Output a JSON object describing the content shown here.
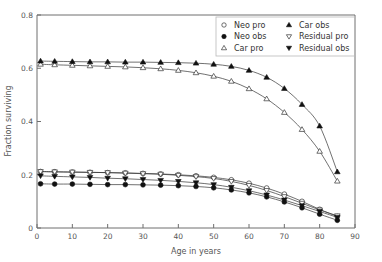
{
  "chart_data": {
    "type": "line",
    "title": "",
    "xlabel": "Age in years",
    "ylabel": "Fraction surviving",
    "xlim": [
      0,
      90
    ],
    "ylim": [
      0,
      0.8
    ],
    "xticks": [
      "0",
      "10",
      "20",
      "30",
      "40",
      "50",
      "60",
      "70",
      "80",
      "90"
    ],
    "xtick_values": [
      0,
      10,
      20,
      30,
      40,
      50,
      60,
      70,
      80,
      90
    ],
    "yticks": [
      "0",
      "0.2",
      "0.4",
      "0.6",
      "0.8"
    ],
    "ytick_values": [
      0,
      0.2,
      0.4,
      0.6,
      0.8
    ],
    "grid": false,
    "legend_position": "top-right",
    "x": [
      1,
      5,
      10,
      15,
      20,
      25,
      30,
      35,
      40,
      45,
      50,
      55,
      60,
      65,
      70,
      75,
      80,
      85
    ],
    "series": [
      {
        "name": "Neo pro",
        "marker": "open-circle",
        "values": [
          0.212,
          0.211,
          0.21,
          0.209,
          0.208,
          0.207,
          0.205,
          0.203,
          0.2,
          0.196,
          0.19,
          0.181,
          0.168,
          0.15,
          0.127,
          0.1,
          0.07,
          0.043
        ]
      },
      {
        "name": "Neo obs",
        "marker": "filled-circle",
        "values": [
          0.166,
          0.165,
          0.165,
          0.164,
          0.163,
          0.163,
          0.162,
          0.161,
          0.159,
          0.156,
          0.151,
          0.143,
          0.132,
          0.117,
          0.098,
          0.076,
          0.052,
          0.029
        ]
      },
      {
        "name": "Car pro",
        "marker": "open-triangle-up",
        "values": [
          0.615,
          0.613,
          0.611,
          0.609,
          0.607,
          0.605,
          0.602,
          0.598,
          0.592,
          0.583,
          0.57,
          0.551,
          0.523,
          0.485,
          0.434,
          0.37,
          0.288,
          0.176
        ]
      },
      {
        "name": "Car obs",
        "marker": "filled-triangle-up",
        "values": [
          0.627,
          0.626,
          0.625,
          0.624,
          0.624,
          0.623,
          0.623,
          0.622,
          0.621,
          0.619,
          0.615,
          0.607,
          0.592,
          0.566,
          0.524,
          0.464,
          0.383,
          0.211
        ]
      },
      {
        "name": "Residual pro",
        "marker": "open-triangle-down",
        "values": [
          0.212,
          0.211,
          0.21,
          0.209,
          0.208,
          0.206,
          0.204,
          0.202,
          0.198,
          0.193,
          0.186,
          0.175,
          0.16,
          0.141,
          0.118,
          0.093,
          0.068,
          0.046
        ]
      },
      {
        "name": "Residual obs",
        "marker": "filled-triangle-down",
        "values": [
          0.196,
          0.194,
          0.192,
          0.19,
          0.187,
          0.185,
          0.182,
          0.179,
          0.175,
          0.17,
          0.163,
          0.153,
          0.14,
          0.124,
          0.105,
          0.084,
          0.062,
          0.04
        ]
      }
    ],
    "legend": [
      {
        "label": "Neo pro",
        "marker": "open-circle"
      },
      {
        "label": "Neo obs",
        "marker": "filled-circle"
      },
      {
        "label": "Car pro",
        "marker": "open-triangle-up"
      },
      {
        "label": "Car obs",
        "marker": "filled-triangle-up"
      },
      {
        "label": "Residual pro",
        "marker": "open-triangle-down"
      },
      {
        "label": "Residual obs",
        "marker": "filled-triangle-down"
      }
    ]
  }
}
